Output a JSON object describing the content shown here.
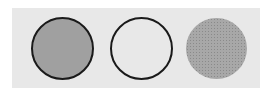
{
  "panel": {
    "background": "#e8e8e8"
  },
  "circles": [
    {
      "style": "filled",
      "fill": "#a0a0a0",
      "border": "#1a1a1a"
    },
    {
      "style": "outline",
      "fill": "transparent",
      "border": "#1a1a1a"
    },
    {
      "style": "dotted",
      "fill": "#a8a8a8",
      "border": "none"
    }
  ]
}
